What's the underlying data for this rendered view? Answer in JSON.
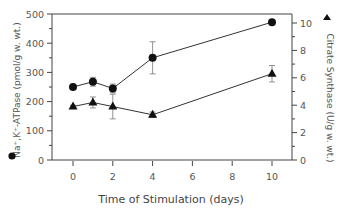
{
  "chart_data": {
    "type": "line",
    "title": "",
    "xlabel": "Time of Stimulation (days)",
    "ylabel": "Na+,K+-ATPase (pmol/g w. wt.)",
    "ylabel_right": "Citrate Synthase (U/g w. wt.)",
    "xlim": [
      -1,
      11
    ],
    "ylim": [
      0,
      500
    ],
    "ylim_right": [
      0,
      10.7
    ],
    "x_ticks": [
      0,
      2,
      4,
      6,
      8,
      10
    ],
    "y_ticks": [
      0,
      100,
      200,
      300,
      400,
      500
    ],
    "y_ticks_right": [
      0,
      2,
      4,
      6,
      8,
      10
    ],
    "grid": false,
    "legend": "markers beside axis titles (circle = left axis, triangle = right axis)",
    "series": [
      {
        "name": "Na+,K+-ATPase",
        "marker": "circle",
        "axis": "left",
        "x": [
          0,
          1,
          2,
          4,
          10
        ],
        "values": [
          250,
          268,
          245,
          350,
          472
        ],
        "error": [
          5,
          15,
          15,
          55,
          5
        ]
      },
      {
        "name": "Citrate Synthase",
        "marker": "triangle",
        "axis": "right",
        "x": [
          0,
          1,
          2,
          4,
          10
        ],
        "values": [
          3.9,
          4.2,
          3.9,
          3.3,
          6.3
        ],
        "error": [
          0.1,
          0.4,
          0.9,
          0.2,
          0.6
        ]
      }
    ]
  },
  "labels": {
    "y_left_title": "Na⁺,K⁺-ATPase (pmol/g w. wt.)",
    "y_right_title": "Citrate Synthase (U/g w. wt.)",
    "x_title": "Time of Stimulation (days)",
    "left_marker": "●",
    "right_marker": "▲"
  }
}
